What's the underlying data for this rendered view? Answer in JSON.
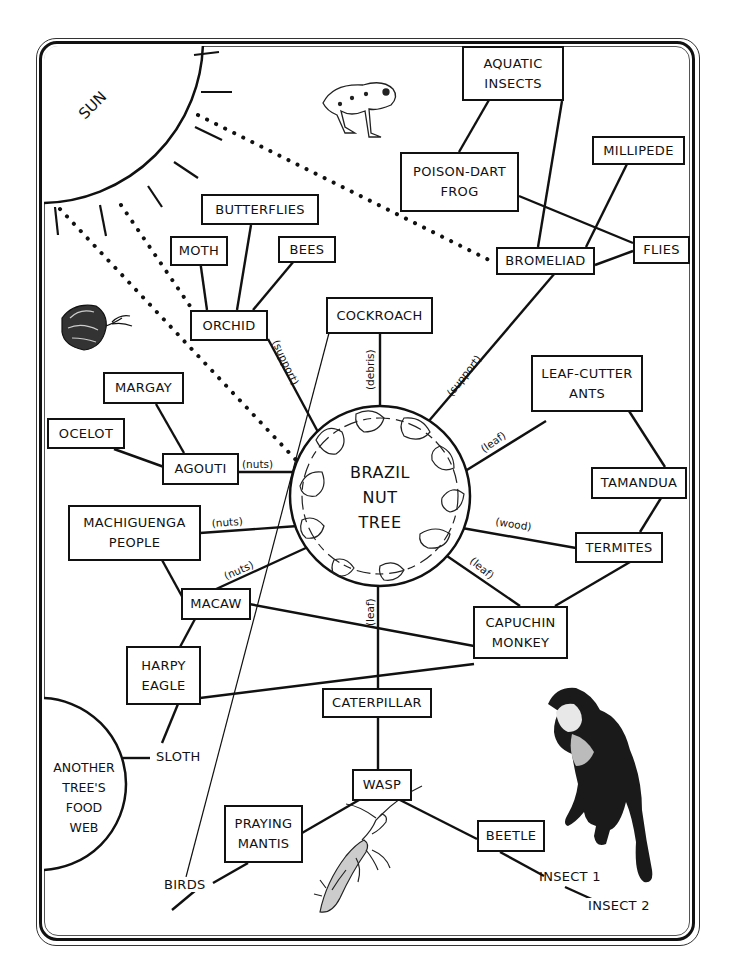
{
  "center": {
    "lines": [
      "BRAZIL",
      "NUT",
      "TREE"
    ]
  },
  "sun": {
    "label": "SUN"
  },
  "another_web": {
    "lines": [
      "ANOTHER",
      "TREE'S",
      "FOOD",
      "WEB"
    ]
  },
  "nodes": {
    "aquatic_insects": [
      "AQUATIC",
      "INSECTS"
    ],
    "poison_dart_frog": [
      "POISON-DART",
      "FROG"
    ],
    "millipede": [
      "MILLIPEDE"
    ],
    "flies": [
      "FLIES"
    ],
    "bromeliad": [
      "BROMELIAD"
    ],
    "butterflies": [
      "BUTTERFLIES"
    ],
    "moth": [
      "MOTH"
    ],
    "bees": [
      "BEES"
    ],
    "orchid": [
      "ORCHID"
    ],
    "cockroach": [
      "COCKROACH"
    ],
    "margay": [
      "MARGAY"
    ],
    "ocelot": [
      "OCELOT"
    ],
    "agouti": [
      "AGOUTI"
    ],
    "leaf_cutter_ants": [
      "LEAF-CUTTER",
      "ANTS"
    ],
    "tamandua": [
      "TAMANDUA"
    ],
    "machiguenga_people": [
      "MACHIGUENGA",
      "PEOPLE"
    ],
    "termites": [
      "TERMITES"
    ],
    "macaw": [
      "MACAW"
    ],
    "capuchin_monkey": [
      "CAPUCHIN",
      "MONKEY"
    ],
    "harpy_eagle": [
      "HARPY",
      "EAGLE"
    ],
    "caterpillar": [
      "CATERPILLAR"
    ],
    "wasp": [
      "WASP"
    ],
    "praying_mantis": [
      "PRAYING",
      "MANTIS"
    ],
    "beetle": [
      "BEETLE"
    ]
  },
  "plain_labels": {
    "sloth": "SLOTH",
    "birds": "BIRDS",
    "insect1": "INSECT 1",
    "insect2": "INSECT 2"
  },
  "edge_labels": {
    "orchid_support": "(support)",
    "cockroach_debris": "(debris)",
    "bromeliad_support": "(support)",
    "ants_leaf": "(leaf)",
    "agouti_nuts": "(nuts)",
    "people_nuts": "(nuts)",
    "macaw_nuts": "(nuts)",
    "termites_wood": "(wood)",
    "capuchin_leaf": "(leaf)",
    "caterpillar_leaf": "(leaf)"
  },
  "illustrations": [
    "poison-dart-frog-drawing",
    "butterfly-drawing",
    "capuchin-monkey-drawing",
    "praying-mantis-drawing"
  ]
}
